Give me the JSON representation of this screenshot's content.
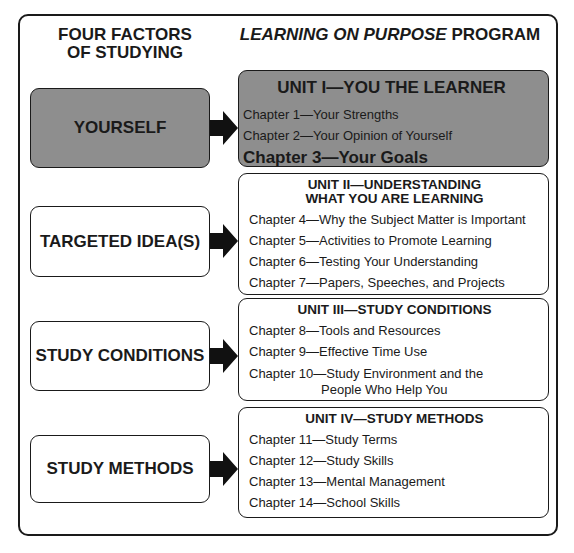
{
  "headers": {
    "left_line1": "FOUR FACTORS",
    "left_line2": "OF STUDYING",
    "right_italic": "LEARNING ON PURPOSE",
    "right_rest": " PROGRAM"
  },
  "colors": {
    "highlight_gray": "#8e8e8e",
    "stroke": "#1a1a1a"
  },
  "factors": [
    {
      "label": "YOURSELF",
      "highlighted": true
    },
    {
      "label": "TARGETED IDEA(S)",
      "highlighted": false
    },
    {
      "label": "STUDY CONDITIONS",
      "highlighted": false
    },
    {
      "label": "STUDY METHODS",
      "highlighted": false
    }
  ],
  "units": [
    {
      "title": "UNIT I—YOU THE LEARNER",
      "highlighted": true,
      "chapters": [
        "Chapter 1—Your Strengths",
        "Chapter 2—Your Opinion of Yourself",
        "Chapter 3—Your Goals"
      ]
    },
    {
      "title_line1": "UNIT II—UNDERSTANDING",
      "title_line2": "WHAT YOU ARE LEARNING",
      "highlighted": false,
      "chapters": [
        "Chapter 4—Why the Subject Matter is Important",
        "Chapter 5—Activities to Promote Learning",
        "Chapter 6—Testing Your Understanding",
        "Chapter 7—Papers, Speeches, and Projects"
      ]
    },
    {
      "title": "UNIT III—STUDY CONDITIONS",
      "highlighted": false,
      "chapters": [
        "Chapter 8—Tools and Resources",
        "Chapter 9—Effective Time Use",
        "Chapter 10—Study Environment and the",
        "People Who Help You"
      ]
    },
    {
      "title": "UNIT IV—STUDY METHODS",
      "highlighted": false,
      "chapters": [
        "Chapter 11—Study Terms",
        "Chapter 12—Study Skills",
        "Chapter 13—Mental Management",
        "Chapter 14—School Skills"
      ]
    }
  ]
}
